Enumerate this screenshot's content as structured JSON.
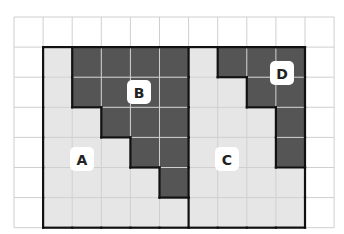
{
  "diagram": {
    "title_fragment": "",
    "grid": {
      "columns": 11,
      "rows": 7
    },
    "outer_region": {
      "col_start": 1,
      "col_end": 9,
      "row_start": 1,
      "row_end": 6
    },
    "colors": {
      "light": "#e6e6e6",
      "dark": "#555555",
      "gridline": "#cfcfcf",
      "border": "#111111",
      "badge_bg": "#ffffff"
    },
    "dark_cells": [
      [
        2,
        1
      ],
      [
        3,
        1
      ],
      [
        4,
        1
      ],
      [
        5,
        1
      ],
      [
        2,
        2
      ],
      [
        3,
        2
      ],
      [
        4,
        2
      ],
      [
        5,
        2
      ],
      [
        3,
        3
      ],
      [
        4,
        3
      ],
      [
        5,
        3
      ],
      [
        4,
        4
      ],
      [
        5,
        4
      ],
      [
        5,
        5
      ],
      [
        7,
        1
      ],
      [
        8,
        1
      ],
      [
        9,
        1
      ],
      [
        8,
        2
      ],
      [
        9,
        2
      ],
      [
        9,
        3
      ],
      [
        9,
        4
      ]
    ],
    "labels": [
      {
        "text": "A",
        "region": "left-light"
      },
      {
        "text": "B",
        "region": "left-dark"
      },
      {
        "text": "C",
        "region": "right-light"
      },
      {
        "text": "D",
        "region": "right-dark"
      }
    ]
  }
}
